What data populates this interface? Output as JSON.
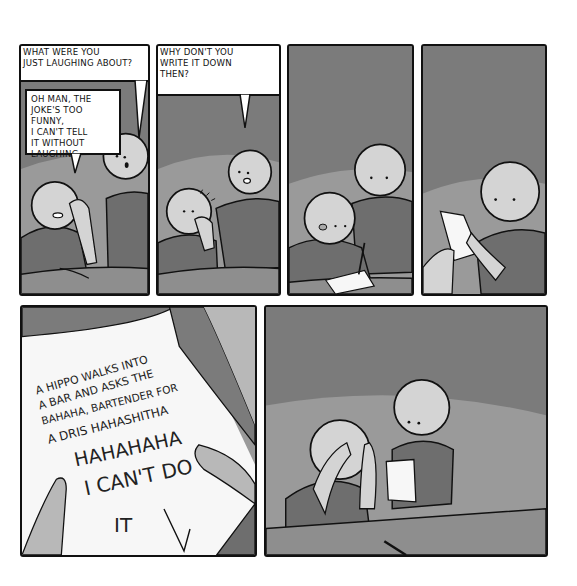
{
  "comic": {
    "colors": {
      "wall": "#7b7b7b",
      "wall_light": "#9a9a9a",
      "skin": "#d4d4d4",
      "shirt": "#6e6e6e",
      "table": "#8e8e8e",
      "paper": "#f7f7f7",
      "ink": "#111111"
    },
    "panels": [
      {
        "id": 1,
        "bubbles": [
          {
            "speaker": "standing-person",
            "text": "WHAT WERE YOU\nJUST LAUGHING ABOUT?"
          },
          {
            "speaker": "seated-person",
            "text": "OH MAN, THE\nJOKE'S TOO FUNNY,\nI CAN'T TELL\nIT WITHOUT\nLAUGHING."
          }
        ]
      },
      {
        "id": 2,
        "bubbles": [
          {
            "speaker": "standing-person",
            "text": "WHY DON'T YOU\nWRITE IT DOWN\nTHEN?"
          }
        ]
      },
      {
        "id": 3,
        "bubbles": [],
        "description": "seated person writes on paper with pencil, tongue out"
      },
      {
        "id": 4,
        "bubbles": [],
        "description": "standing person reads the paper"
      },
      {
        "id": 5,
        "description": "close-up of the handwritten note",
        "note_lines": [
          "A HIPPO WALKS INTO",
          "A BAR AND ASKS THE",
          "BAHAHA, BARTENDER FOR",
          "A DRIS HAHASHITHA",
          "HAHAHAHA",
          "I CAN'T DO",
          "IT"
        ]
      },
      {
        "id": 6,
        "bubbles": [],
        "description": "seated person face-palms with both hands, pencil dropped on table, standing person holds note"
      }
    ]
  }
}
